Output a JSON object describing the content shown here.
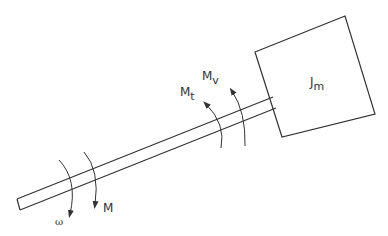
{
  "diagram": {
    "type": "mechanical-shaft-inertia",
    "colors": {
      "stroke": "#333333",
      "background": "#ffffff"
    },
    "labels": {
      "inertia": {
        "main": "J",
        "sub": "m"
      },
      "torque_t": {
        "main": "M",
        "sub": "t"
      },
      "torque_v": {
        "main": "M",
        "sub": "v"
      },
      "torque_m": {
        "main": "M"
      },
      "omega": {
        "main": "ω"
      }
    },
    "elements": [
      {
        "id": "inertia-box",
        "label": "J_m"
      },
      {
        "id": "shaft"
      },
      {
        "id": "arrow-omega",
        "label": "ω",
        "direction": "down"
      },
      {
        "id": "arrow-M",
        "label": "M",
        "direction": "down"
      },
      {
        "id": "arrow-Mt",
        "label": "M_t",
        "direction": "up"
      },
      {
        "id": "arrow-Mv",
        "label": "M_v",
        "direction": "up"
      }
    ]
  }
}
